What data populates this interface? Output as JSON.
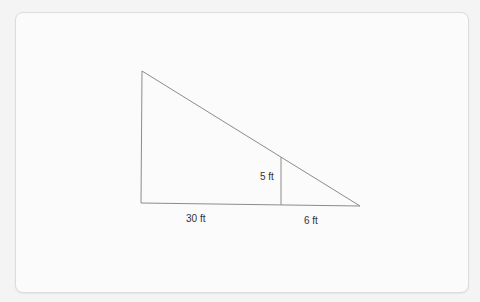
{
  "diagram": {
    "type": "similar-triangles",
    "line_color": "#8c8c8c",
    "label_color": "#333333",
    "labels": {
      "inner_height": "5 ft",
      "left_base": "30 ft",
      "right_base": "6 ft"
    },
    "shapes": {
      "outer_triangle": {
        "vertices": [
          [
            142,
            71
          ],
          [
            141,
            203
          ],
          [
            360,
            206
          ]
        ]
      },
      "inner_segment": {
        "from": [
          281,
          156
        ],
        "to": [
          281,
          204
        ]
      }
    }
  }
}
